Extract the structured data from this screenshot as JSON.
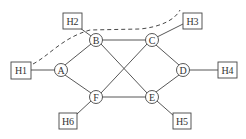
{
  "diagram": {
    "routers": [
      {
        "id": "A",
        "label": "A",
        "x": 61,
        "y": 70
      },
      {
        "id": "B",
        "label": "B",
        "x": 96,
        "y": 40
      },
      {
        "id": "C",
        "label": "C",
        "x": 152,
        "y": 40
      },
      {
        "id": "D",
        "label": "D",
        "x": 183,
        "y": 70
      },
      {
        "id": "E",
        "label": "E",
        "x": 152,
        "y": 97
      },
      {
        "id": "F",
        "label": "F",
        "x": 96,
        "y": 97
      }
    ],
    "hosts": [
      {
        "id": "H1",
        "label": "H1",
        "x": 21,
        "y": 70,
        "attached_to": "A"
      },
      {
        "id": "H2",
        "label": "H2",
        "x": 72,
        "y": 21,
        "attached_to": "B"
      },
      {
        "id": "H3",
        "label": "H3",
        "x": 192,
        "y": 21,
        "attached_to": "C"
      },
      {
        "id": "H4",
        "label": "H4",
        "x": 227,
        "y": 70,
        "attached_to": "D"
      },
      {
        "id": "H5",
        "label": "H5",
        "x": 182,
        "y": 121,
        "attached_to": "E"
      },
      {
        "id": "H6",
        "label": "H6",
        "x": 68,
        "y": 121,
        "attached_to": "F"
      }
    ],
    "links": [
      [
        "A",
        "B"
      ],
      [
        "A",
        "F"
      ],
      [
        "B",
        "C"
      ],
      [
        "B",
        "E"
      ],
      [
        "C",
        "F"
      ],
      [
        "C",
        "D"
      ],
      [
        "D",
        "E"
      ],
      [
        "E",
        "F"
      ]
    ],
    "dashed_path": {
      "description": "dashed curve from H1 over B toward H3"
    }
  }
}
